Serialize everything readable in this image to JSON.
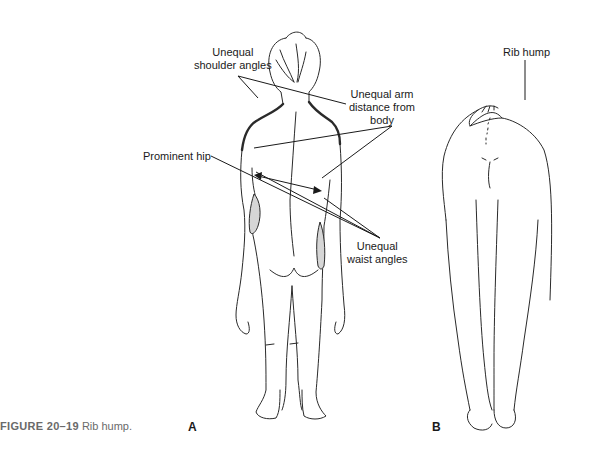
{
  "figure": {
    "caption_number": "FIGURE 20–19",
    "caption_text": "Rib hump.",
    "panels": [
      {
        "letter": "A",
        "view": "standing posterior view"
      },
      {
        "letter": "B",
        "view": "forward bend posterior view"
      }
    ],
    "annotations": {
      "unequal_shoulder_angles": "Unequal\nshoulder angles",
      "unequal_shoulder_line1": "Unequal",
      "unequal_shoulder_line2": "shoulder angles",
      "unequal_arm_line1": "Unequal arm",
      "unequal_arm_line2": "distance from",
      "unequal_arm_line3": "body",
      "prominent_hip": "Prominent hip",
      "unequal_waist_line1": "Unequal",
      "unequal_waist_line2": "waist angles",
      "rib_hump": "Rib hump"
    },
    "colors": {
      "line": "#2a2a2a",
      "shading": "#d6d6d6",
      "caption": "#6a6a6a"
    }
  }
}
